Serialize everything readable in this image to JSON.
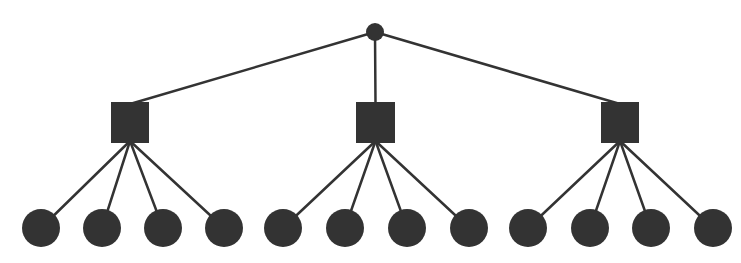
{
  "diagram": {
    "type": "tree",
    "colors": {
      "node": "#333333",
      "edge": "#333333",
      "background": "#ffffff"
    },
    "root": {
      "id": "root",
      "shape": "circle",
      "cx": 375,
      "cy": 32,
      "r": 9
    },
    "branches": [
      {
        "id": "branch-1",
        "shape": "square",
        "x": 111,
        "y": 102,
        "w": 38,
        "h": 41,
        "leaves": [
          {
            "cx": 41,
            "cy": 228
          },
          {
            "cx": 102,
            "cy": 228
          },
          {
            "cx": 163,
            "cy": 228
          },
          {
            "cx": 224,
            "cy": 228
          }
        ]
      },
      {
        "id": "branch-2",
        "shape": "square",
        "x": 356,
        "y": 102,
        "w": 39,
        "h": 41,
        "leaves": [
          {
            "cx": 283,
            "cy": 228
          },
          {
            "cx": 345,
            "cy": 228
          },
          {
            "cx": 407,
            "cy": 228
          },
          {
            "cx": 469,
            "cy": 228
          }
        ]
      },
      {
        "id": "branch-3",
        "shape": "square",
        "x": 601,
        "y": 102,
        "w": 38,
        "h": 41,
        "leaves": [
          {
            "cx": 528,
            "cy": 228
          },
          {
            "cx": 590,
            "cy": 228
          },
          {
            "cx": 651,
            "cy": 228
          },
          {
            "cx": 713,
            "cy": 228
          }
        ]
      }
    ],
    "leaf_radius": 19,
    "edge_width": 2.5
  }
}
